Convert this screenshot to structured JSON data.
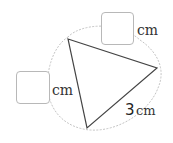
{
  "figure": {
    "shape": "triangle",
    "vertices": [
      [
        68,
        39
      ],
      [
        157,
        68
      ],
      [
        87,
        128
      ]
    ],
    "outline": "dotted circumscribed curve",
    "colors": {
      "edge": "#444444",
      "dotted_outline": "#bdbdbd",
      "box_border": "#b8b8b8"
    }
  },
  "labels": {
    "top_side": {
      "value": "",
      "unit": "cm"
    },
    "left_side": {
      "value": "",
      "unit": "cm"
    },
    "bottom_right_side": {
      "value": "3",
      "unit": "cm"
    }
  }
}
